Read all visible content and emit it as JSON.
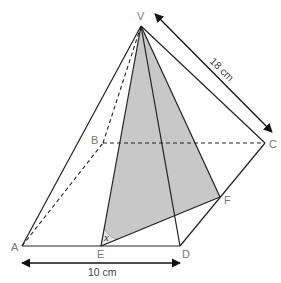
{
  "figure": {
    "type": "square-based pyramid",
    "shading_color": "#c8c8c8",
    "vertices": {
      "V": {
        "label": "V",
        "x": 141,
        "y": 26
      },
      "A": {
        "label": "A",
        "x": 22,
        "y": 246
      },
      "B": {
        "label": "B",
        "x": 103,
        "y": 143
      },
      "C": {
        "label": "C",
        "x": 265,
        "y": 143
      },
      "D": {
        "label": "D",
        "x": 180,
        "y": 246
      },
      "E": {
        "label": "E",
        "x": 101,
        "y": 246
      },
      "F": {
        "label": "F",
        "x": 220,
        "y": 197
      }
    },
    "solid_edges": [
      [
        "V",
        "A"
      ],
      [
        "V",
        "C"
      ],
      [
        "V",
        "D"
      ],
      [
        "V",
        "E"
      ],
      [
        "V",
        "F"
      ],
      [
        "A",
        "D"
      ],
      [
        "D",
        "C"
      ],
      [
        "E",
        "F"
      ]
    ],
    "dashed_edges": [
      [
        "V",
        "B"
      ],
      [
        "A",
        "B"
      ],
      [
        "B",
        "C"
      ]
    ],
    "shaded_face": [
      "V",
      "E",
      "F"
    ],
    "angle": {
      "label": "x",
      "vertex": "E"
    },
    "dimensions": {
      "base": {
        "label": "10 cm",
        "from": "A",
        "to": "D"
      },
      "slant_edge": {
        "label": "18 cm",
        "from": "V",
        "to": "C"
      }
    }
  }
}
